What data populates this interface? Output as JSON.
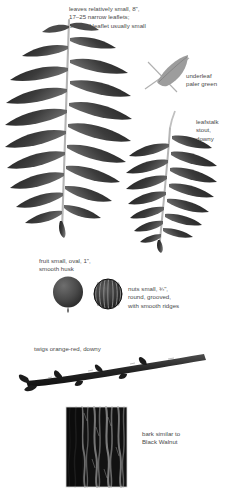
{
  "plate": {
    "title": "Butternut identification plate",
    "background_color": "#ffffff",
    "text_color": "#4a4a4a",
    "foliage_dark": "#2f2f2f",
    "foliage_mid": "#555555",
    "foliage_pale": "#9a9a9a",
    "rachis_color": "#b9b9b9",
    "twig_color": "#242424",
    "bark_dark": "#0d0d0d",
    "bark_light": "#8e8e8e"
  },
  "captions": {
    "leaves": "leaves relatively small, 8\",\n17–25 narrow leaflets;\nterminal leaflet usually small",
    "underleaf": "underleaf\npaler green",
    "leafstalk": "leafstalk\nstout,\ndowny",
    "fruit": "fruit small, oval, 1\",\nsmooth husk",
    "nuts": "nuts small, ¾\",\nround, grooved,\nwith smooth ridges",
    "twigs": "twigs orange-red, downy",
    "bark": "bark similar to\nBlack Walnut"
  },
  "figures": {
    "leaf_main": {
      "name": "compound-leaf-upper",
      "leaflet_pairs": 9,
      "terminal_leaflet": true,
      "leaflet_length": 58,
      "leaflet_width": 11
    },
    "leaf_second": {
      "name": "compound-leaf-lower",
      "leaflet_pairs": 7,
      "terminal_leaflet": true,
      "leaflet_length": 52,
      "leaflet_width": 10
    },
    "underleaf": {
      "name": "single-leaflet-underside",
      "shade": "pale"
    },
    "fruit": {
      "name": "fruit-husk",
      "shape": "oval",
      "size_label": "1\""
    },
    "nut": {
      "name": "nut-grooved",
      "shape": "round-ribbed",
      "size_label": "¾\"",
      "ridges": 9
    },
    "twig": {
      "name": "twig-specimen",
      "buds": 4
    },
    "bark": {
      "name": "bark-photo",
      "texture": "vertical furrows"
    }
  }
}
